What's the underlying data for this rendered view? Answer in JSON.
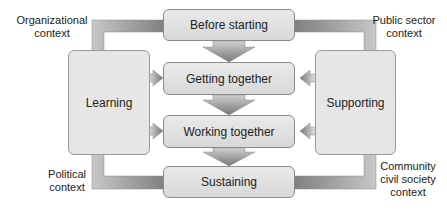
{
  "diagram": {
    "stages": [
      {
        "label": "Before starting"
      },
      {
        "label": "Getting together"
      },
      {
        "label": "Working together"
      },
      {
        "label": "Sustaining"
      }
    ],
    "left_box": {
      "label": "Learning"
    },
    "right_box": {
      "label": "Supporting"
    },
    "contexts": {
      "top_left": {
        "line1": "Organizational",
        "line2": "context"
      },
      "top_right": {
        "line1": "Public sector",
        "line2": "context"
      },
      "bottom_left": {
        "line1": "Political",
        "line2": "context"
      },
      "bottom_right": {
        "line1": "Community",
        "line2": "civil society",
        "line3": "context"
      }
    }
  }
}
